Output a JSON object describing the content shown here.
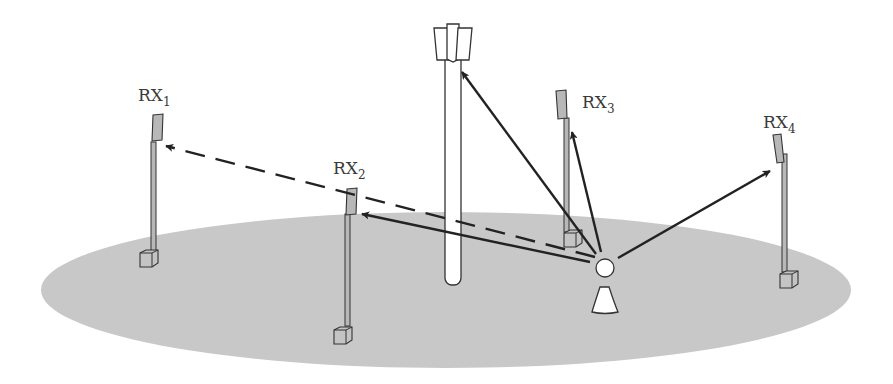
{
  "figure": {
    "colors": {
      "ground": "#c8c8c8",
      "pole_fill": "#b8b8b8",
      "outline": "#333333",
      "arrow": "#222222",
      "tower_fill": "#ffffff"
    }
  },
  "receivers": [
    {
      "id": "rx1",
      "base": "RX",
      "sub": "1"
    },
    {
      "id": "rx2",
      "base": "RX",
      "sub": "2"
    },
    {
      "id": "rx3",
      "base": "RX",
      "sub": "3"
    },
    {
      "id": "rx4",
      "base": "RX",
      "sub": "4"
    }
  ],
  "links": [
    {
      "from": "transmitter",
      "to": "rx1",
      "style": "dashed"
    },
    {
      "from": "transmitter",
      "to": "rx2",
      "style": "solid"
    },
    {
      "from": "transmitter",
      "to": "rx3",
      "style": "solid"
    },
    {
      "from": "transmitter",
      "to": "rx4",
      "style": "solid"
    },
    {
      "from": "transmitter",
      "to": "tower",
      "style": "solid"
    }
  ]
}
